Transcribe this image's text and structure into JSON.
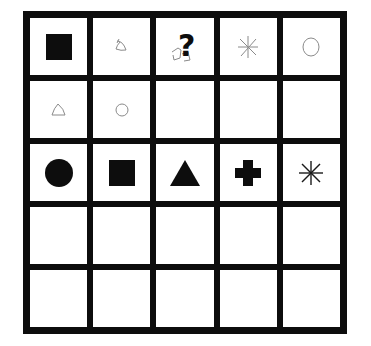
{
  "board": {
    "rows": 5,
    "cols": 5,
    "colors": {
      "line": "#0d0d0d",
      "cell": "#ffffff",
      "solid_piece": "#0d0d0d",
      "sketch_piece": "#8a8a8a"
    },
    "cells": [
      [
        {
          "piece": "square",
          "style": "solid"
        },
        {
          "piece": "triangle",
          "style": "sketch"
        },
        {
          "piece": "question",
          "style": "solid",
          "label": "?"
        },
        {
          "piece": "asterisk",
          "style": "sketch"
        },
        {
          "piece": "circle",
          "style": "sketch"
        }
      ],
      [
        {
          "piece": "triangle",
          "style": "sketch"
        },
        {
          "piece": "circle",
          "style": "sketch"
        },
        {
          "piece": "empty"
        },
        {
          "piece": "empty"
        },
        {
          "piece": "empty"
        }
      ],
      [
        {
          "piece": "circle",
          "style": "solid"
        },
        {
          "piece": "square",
          "style": "solid"
        },
        {
          "piece": "triangle",
          "style": "solid"
        },
        {
          "piece": "cross",
          "style": "solid"
        },
        {
          "piece": "asterisk",
          "style": "solid"
        }
      ],
      [
        {
          "piece": "empty"
        },
        {
          "piece": "empty"
        },
        {
          "piece": "empty"
        },
        {
          "piece": "empty"
        },
        {
          "piece": "empty"
        }
      ],
      [
        {
          "piece": "empty"
        },
        {
          "piece": "empty"
        },
        {
          "piece": "empty"
        },
        {
          "piece": "empty"
        },
        {
          "piece": "empty"
        }
      ]
    ]
  }
}
